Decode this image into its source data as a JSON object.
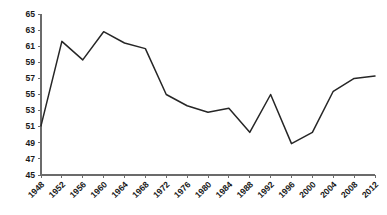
{
  "chart_data": {
    "type": "line",
    "title": "",
    "subtitle": "",
    "xlabel": "",
    "ylabel": "",
    "x": [
      1948,
      1952,
      1956,
      1960,
      1964,
      1968,
      1972,
      1976,
      1980,
      1984,
      1988,
      1992,
      1996,
      2000,
      2004,
      2008,
      2012
    ],
    "categories": [
      "1948",
      "1952",
      "1956",
      "1960",
      "1964",
      "1968",
      "1972",
      "1976",
      "1980",
      "1984",
      "1988",
      "1992",
      "1996",
      "2000",
      "2004",
      "2008",
      "2012"
    ],
    "values": [
      51.1,
      61.6,
      59.3,
      62.8,
      61.4,
      60.7,
      55.0,
      53.6,
      52.8,
      53.3,
      50.3,
      55.0,
      48.9,
      50.3,
      55.4,
      57.0,
      57.3
    ],
    "series": [
      {
        "name": "",
        "values": [
          51.1,
          61.6,
          59.3,
          62.8,
          61.4,
          60.7,
          55.0,
          53.6,
          52.8,
          53.3,
          50.3,
          55.0,
          48.9,
          50.3,
          57.0,
          57.0,
          57.3
        ]
      }
    ],
    "xlim": [
      1948,
      2012
    ],
    "ylim": [
      45,
      65
    ],
    "y_ticks": [
      45,
      47,
      49,
      51,
      53,
      55,
      57,
      59,
      61,
      63,
      65
    ],
    "y_tick_labels": [
      "45",
      "47",
      "49",
      "51",
      "53",
      "55",
      "57",
      "59",
      "61",
      "63",
      "65"
    ],
    "x_ticks": [
      1948,
      1952,
      1956,
      1960,
      1964,
      1968,
      1972,
      1976,
      1980,
      1984,
      1988,
      1992,
      1996,
      2000,
      2004,
      2008,
      2012
    ],
    "x_tick_labels": [
      "1948",
      "1952",
      "1956",
      "1960",
      "1964",
      "1968",
      "1972",
      "1976",
      "1980",
      "1984",
      "1988",
      "1992",
      "1996",
      "2000",
      "2004",
      "2008",
      "2012"
    ],
    "x_tick_label_rotation": -45,
    "grid": false,
    "legend": false,
    "legend_position": "none",
    "line_color": "#262626",
    "axis_color": "#6b6b6b",
    "background_color": "#ffffff",
    "annotations": []
  },
  "layout": {
    "plot_left": 41,
    "plot_right": 375,
    "plot_top": 14,
    "plot_bottom": 175
  }
}
